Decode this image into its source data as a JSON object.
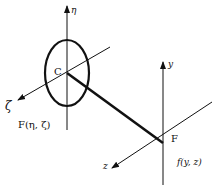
{
  "diagram": {
    "labels": {
      "eta_axis": "η",
      "zeta_axis": "ζ",
      "center": "C",
      "face_function": "F(η, ζ)",
      "y_axis": "y",
      "z_axis": "z",
      "point": "F",
      "image_function": "f(y, z)"
    },
    "colors": {
      "ink": "#111111",
      "background": "#ffffff"
    }
  }
}
